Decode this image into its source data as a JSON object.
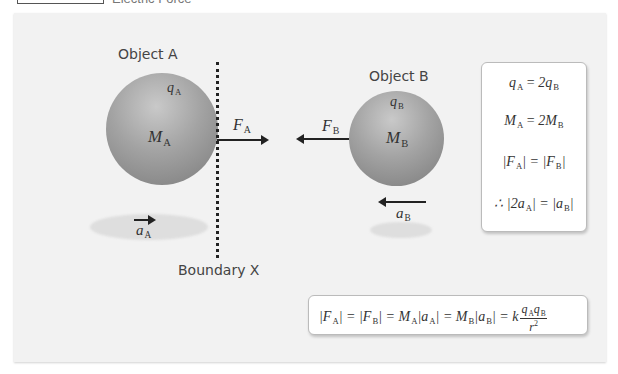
{
  "header": {
    "title": "Electric Force"
  },
  "diagram": {
    "object_a": {
      "label": "Object A",
      "charge": "q",
      "charge_sub": "A",
      "mass": "M",
      "mass_sub": "A",
      "force": "F",
      "force_sub": "A",
      "accel": "a",
      "accel_sub": "A",
      "color": "#8a8a8a"
    },
    "object_b": {
      "label": "Object B",
      "charge": "q",
      "charge_sub": "B",
      "mass": "M",
      "mass_sub": "B",
      "force": "F",
      "force_sub": "B",
      "accel": "a",
      "accel_sub": "B",
      "color": "#8a8a8a"
    },
    "boundary": {
      "label": "Boundary X"
    }
  },
  "equations": {
    "lines": [
      "qₐ = 2qʙ",
      "Mₐ = 2Mʙ",
      "|Fₐ| = |Fʙ|",
      "∴ |2aₐ| = |aʙ|"
    ],
    "line1": {
      "lhs": "q",
      "lhs_sub": "A",
      "op": "=",
      "rhs": "2q",
      "rhs_sub": "B"
    },
    "line2": {
      "lhs": "M",
      "lhs_sub": "A",
      "op": "=",
      "rhs": "2M",
      "rhs_sub": "B"
    },
    "line3": {
      "lhs": "|F",
      "lhs_sub": "A",
      "mid": "| = |F",
      "rhs_sub": "B",
      "end": "|"
    },
    "line4": {
      "lhs": "∴ |2a",
      "lhs_sub": "A",
      "mid": "| = |a",
      "rhs_sub": "B",
      "end": "|"
    }
  },
  "formula": {
    "p1": "|F",
    "s1": "A",
    "p2": "| = |F",
    "s2": "B",
    "p3": "| = M",
    "s3": "A",
    "p4": "|a",
    "s4": "A",
    "p5": "| = M",
    "s5": "B",
    "p6": "|a",
    "s6": "B",
    "p7": "| = k",
    "num_a": "q",
    "num_a_sub": "A",
    "num_b": "q",
    "num_b_sub": "B",
    "den": "r",
    "den_sup": "2"
  }
}
